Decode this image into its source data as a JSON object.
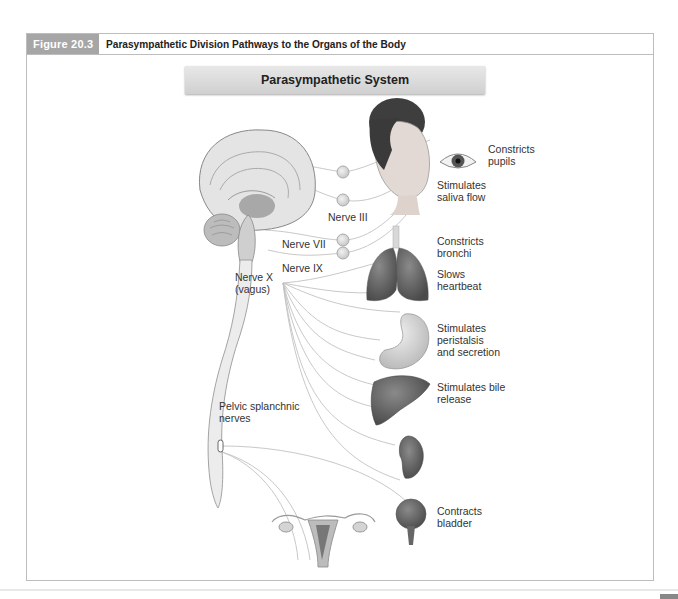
{
  "figure": {
    "number": "Figure 20.3",
    "title": "Parasympathetic Division Pathways to the Organs of the Body",
    "banner": "Parasympathetic System"
  },
  "labels": {
    "eye": [
      "Constricts",
      "pupils"
    ],
    "saliva": [
      "Stimulates",
      "saliva flow"
    ],
    "bronchi": [
      "Constricts",
      "bronchi"
    ],
    "heart": [
      "Slows",
      "heartbeat"
    ],
    "stomach": [
      "Stimulates",
      "peristalsis",
      "and secretion"
    ],
    "liver": [
      "Stimulates bile",
      "release"
    ],
    "bladder": [
      "Contracts",
      "bladder"
    ],
    "nerve_iii": "Nerve III",
    "nerve_vii": "Nerve VII",
    "nerve_ix": "Nerve IX",
    "nerve_x": [
      "Nerve X",
      "(vagus)"
    ],
    "pelvic": [
      "Pelvic splanchnic",
      "nerves"
    ]
  },
  "colors": {
    "fig_num_bg": "#a6a6a6",
    "frame_border": "#bdbdbd",
    "banner_bg": "#dcdcdc",
    "organ_dark": "#5a5a5a",
    "organ_mid": "#9a9a9a",
    "organ_light": "#d4d4d4",
    "nerve_line": "#bcbcbc"
  }
}
